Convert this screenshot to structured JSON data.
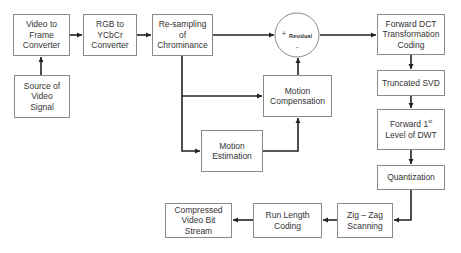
{
  "diagram": {
    "nodes": [
      {
        "id": "video_to_frame",
        "lines": [
          "Video to",
          "Frame",
          "Converter"
        ]
      },
      {
        "id": "source",
        "lines": [
          "Source of",
          "Video",
          "Signal"
        ]
      },
      {
        "id": "rgb_to_ycbcr",
        "lines": [
          "RGB to",
          "YCbCr",
          "Converter"
        ]
      },
      {
        "id": "resampling",
        "lines": [
          "Re-sampling",
          "of",
          "Chrominance"
        ]
      },
      {
        "id": "residual",
        "label": "Residual",
        "plus": "+",
        "minus": "-"
      },
      {
        "id": "forward_dct",
        "lines": [
          "Forward DCT",
          "Transformation",
          "Coding"
        ]
      },
      {
        "id": "truncated_svd",
        "lines": [
          "Truncated SVD"
        ]
      },
      {
        "id": "forward_dwt",
        "line1": "Forward 1",
        "sup": "st",
        "line2": "Level of DWT"
      },
      {
        "id": "quantization",
        "lines": [
          "Quantization"
        ]
      },
      {
        "id": "zigzag",
        "lines": [
          "Zig – Zag",
          "Scanning"
        ]
      },
      {
        "id": "run_length",
        "lines": [
          "Run Length",
          "Coding"
        ]
      },
      {
        "id": "compressed",
        "lines": [
          "Compressed",
          "Video Bit",
          "Stream"
        ]
      },
      {
        "id": "motion_comp",
        "lines": [
          "Motion",
          "Compensation"
        ]
      },
      {
        "id": "motion_est",
        "lines": [
          "Motion",
          "Estimation"
        ]
      }
    ],
    "edges": [
      [
        "source",
        "video_to_frame"
      ],
      [
        "video_to_frame",
        "rgb_to_ycbcr"
      ],
      [
        "rgb_to_ycbcr",
        "resampling"
      ],
      [
        "resampling",
        "residual"
      ],
      [
        "resampling",
        "motion_comp"
      ],
      [
        "resampling",
        "motion_est"
      ],
      [
        "motion_est",
        "motion_comp"
      ],
      [
        "motion_comp",
        "residual"
      ],
      [
        "residual",
        "forward_dct"
      ],
      [
        "forward_dct",
        "truncated_svd"
      ],
      [
        "truncated_svd",
        "forward_dwt"
      ],
      [
        "forward_dwt",
        "quantization"
      ],
      [
        "quantization",
        "zigzag"
      ],
      [
        "zigzag",
        "run_length"
      ],
      [
        "run_length",
        "compressed"
      ]
    ],
    "colors": {
      "line": "#222222",
      "border": "#8a8a8a",
      "text": "#333333"
    }
  }
}
